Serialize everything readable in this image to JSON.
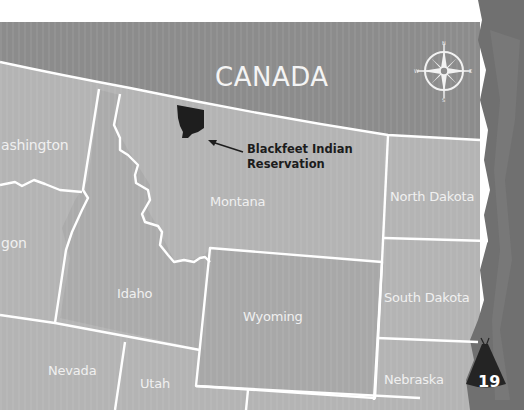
{
  "map": {
    "country_label": "CANADA",
    "states": [
      {
        "name": "Washington",
        "display": "ashington"
      },
      {
        "name": "Oregon",
        "display": "gon"
      },
      {
        "name": "Idaho",
        "display": "Idaho"
      },
      {
        "name": "Montana",
        "display": "Montana"
      },
      {
        "name": "North Dakota",
        "display": "North Dakota"
      },
      {
        "name": "South Dakota",
        "display": "South Dakota"
      },
      {
        "name": "Wyoming",
        "display": "Wyoming"
      },
      {
        "name": "Nevada",
        "display": "Nevada"
      },
      {
        "name": "Utah",
        "display": "Utah"
      },
      {
        "name": "Nebraska",
        "display": "Nebraska"
      }
    ],
    "callout": {
      "line1": "Blackfeet Indian",
      "line2": "Reservation"
    },
    "compass": {
      "n": "N",
      "s": "S",
      "e": "E",
      "w": "W"
    },
    "page_number": "19",
    "colors": {
      "canada_fill": "#8c8c8c",
      "us_fill": "#b4b4b4",
      "border": "#ffffff",
      "reservation": "#1e1e1e",
      "edge_texture": "#6f6f6f",
      "label": "#f0f0f0"
    }
  }
}
